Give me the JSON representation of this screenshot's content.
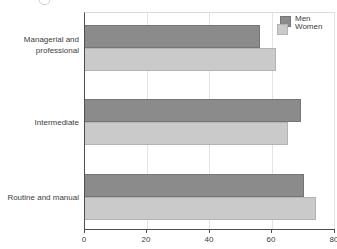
{
  "chart_data": {
    "type": "bar",
    "orientation": "horizontal",
    "title": "",
    "categories": [
      "Managerial and professional",
      "Intermediate",
      "Routine and manual"
    ],
    "series": [
      {
        "name": "Men",
        "values": [
          56,
          69,
          70
        ],
        "color": "#8b8b8b",
        "border_color": "#757575"
      },
      {
        "name": "Women",
        "values": [
          61,
          65,
          74
        ],
        "color": "#cacaca",
        "border_color": "#b3b3b3"
      }
    ],
    "xlabel": "",
    "ylabel": "",
    "xlim": [
      0,
      80
    ],
    "xticks": [
      "0",
      "20",
      "40",
      "60",
      "80"
    ],
    "grid": "vertical gridlines at each x tick",
    "legend_position": "top-right",
    "axis_color": "#4d4d4d",
    "gridline_color": "#e3e3e3"
  }
}
